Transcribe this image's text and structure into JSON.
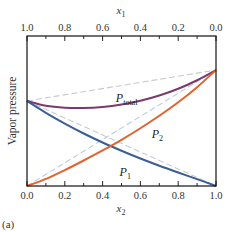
{
  "chart_data": {
    "type": "line",
    "title": "",
    "panel_label": "(a)",
    "xlabel": "x2",
    "xlabel_main": "x",
    "xlabel_sub": "2",
    "x2label": "x1",
    "x2label_main": "x",
    "x2label_sub": "1",
    "ylabel": "Vapor pressure",
    "xlim": [
      0.0,
      1.0
    ],
    "ylim": [
      0.0,
      1.0
    ],
    "x_ticks": [
      "0.0",
      "0.2",
      "0.4",
      "0.6",
      "0.8",
      "1.0"
    ],
    "x_top_ticks": [
      "1.0",
      "0.8",
      "0.6",
      "0.4",
      "0.2",
      "0.0"
    ],
    "y_ticks_shown": false,
    "grid": false,
    "pure_vapor_pressures": {
      "P1_star": 0.567,
      "P2_star": 0.773
    },
    "x": [
      0.0,
      0.1,
      0.2,
      0.3,
      0.4,
      0.5,
      0.6,
      0.7,
      0.8,
      0.9,
      1.0
    ],
    "series": [
      {
        "name": "P_total",
        "label_main": "P",
        "label_sub": "total",
        "color": "#7a3a6e",
        "style": "solid",
        "values": [
          0.567,
          0.535,
          0.522,
          0.52,
          0.527,
          0.543,
          0.568,
          0.603,
          0.648,
          0.705,
          0.773
        ]
      },
      {
        "name": "P1",
        "label_main": "P",
        "label_sub": "1",
        "color": "#3a5f95",
        "style": "solid",
        "values": [
          0.567,
          0.488,
          0.416,
          0.35,
          0.29,
          0.235,
          0.183,
          0.135,
          0.09,
          0.046,
          0.0
        ]
      },
      {
        "name": "P2",
        "label_main": "P",
        "label_sub": "2",
        "color": "#e0642e",
        "style": "solid",
        "values": [
          0.0,
          0.047,
          0.106,
          0.17,
          0.237,
          0.308,
          0.385,
          0.468,
          0.558,
          0.659,
          0.773
        ]
      },
      {
        "name": "Raoult P_total (ideal)",
        "color": "#c9c9d2",
        "style": "dashed",
        "values": [
          0.567,
          0.588,
          0.608,
          0.629,
          0.649,
          0.67,
          0.691,
          0.711,
          0.732,
          0.752,
          0.773
        ]
      },
      {
        "name": "Raoult P1 (ideal)",
        "color": "#c9c9d2",
        "style": "dashed",
        "values": [
          0.567,
          0.51,
          0.454,
          0.397,
          0.34,
          0.284,
          0.227,
          0.17,
          0.113,
          0.057,
          0.0
        ]
      },
      {
        "name": "Raoult P2 (ideal)",
        "color": "#b9cde0",
        "style": "dashed",
        "values": [
          0.0,
          0.077,
          0.155,
          0.232,
          0.309,
          0.387,
          0.464,
          0.541,
          0.618,
          0.696,
          0.773
        ]
      }
    ],
    "annotations": [
      {
        "text_main": "P",
        "text_sub": "total",
        "x": 0.47,
        "y": 0.56
      },
      {
        "text_main": "P",
        "text_sub": "2",
        "x": 0.66,
        "y": 0.32
      },
      {
        "text_main": "P",
        "text_sub": "1",
        "x": 0.49,
        "y": 0.07
      }
    ],
    "legend": null
  }
}
